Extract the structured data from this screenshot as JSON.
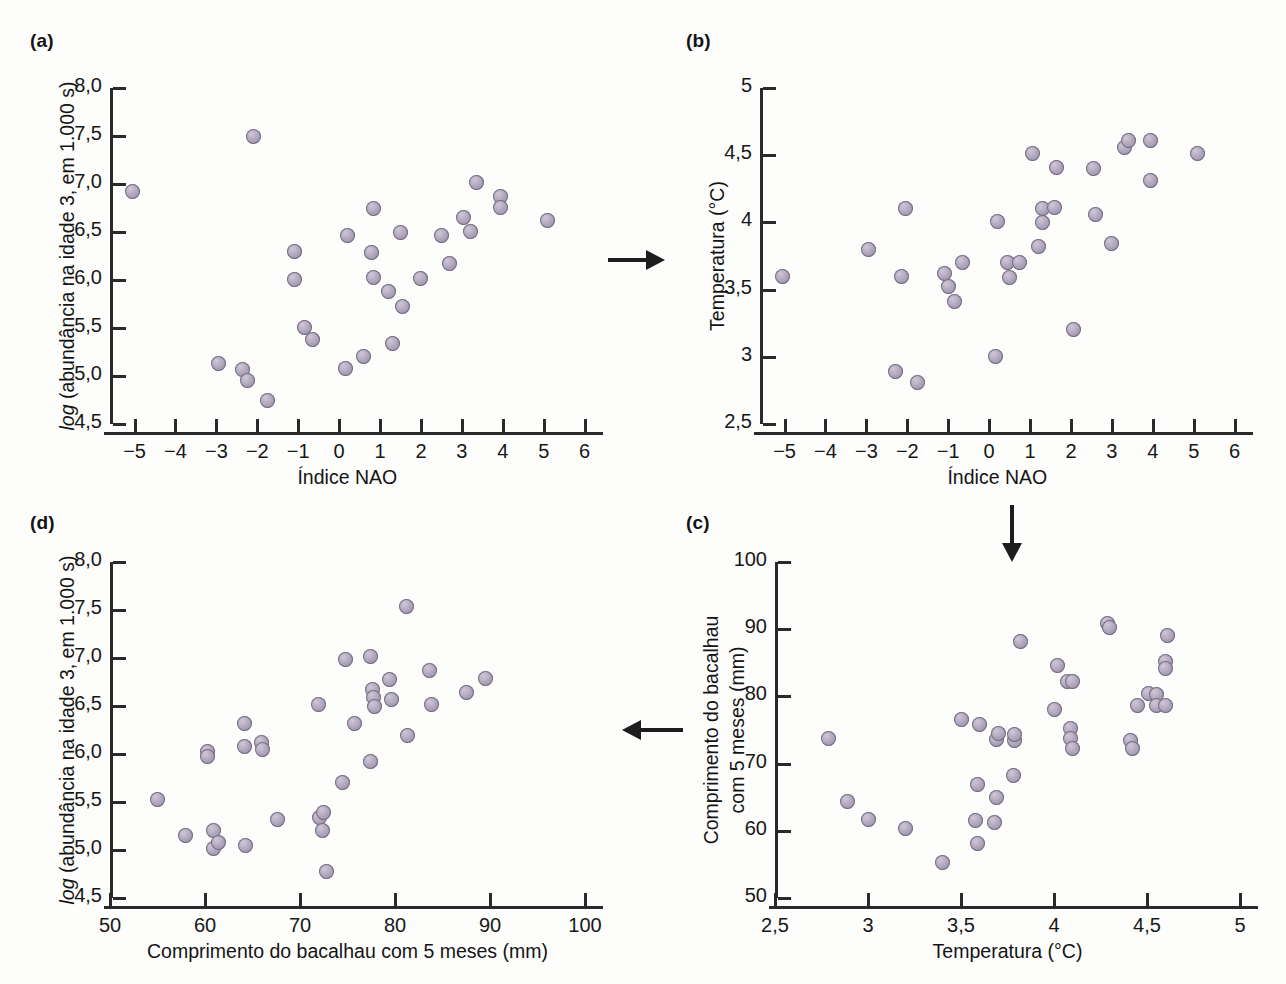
{
  "figure": {
    "background": "#fdfdfc",
    "marker_color": "#a79db5",
    "axis_color": "#2a2a2a",
    "arrow_color": "#1d1d1d"
  },
  "panels": {
    "a": {
      "label": "(a)"
    },
    "b": {
      "label": "(b)"
    },
    "c": {
      "label": "(c)"
    },
    "d": {
      "label": "(d)"
    }
  },
  "arrows": [
    {
      "name": "arrow-a-to-b",
      "direction": "right"
    },
    {
      "name": "arrow-b-to-c",
      "direction": "down"
    },
    {
      "name": "arrow-c-to-d",
      "direction": "left"
    }
  ],
  "labels": {
    "nao_index": "Índice NAO",
    "temperature": "Temperatura (°C)",
    "abundance_pre": "log",
    "abundance_post": " (abundância na idade 3, em 1.000 s)",
    "cod_length_one_line": "Comprimento do bacalhau com 5 meses (mm)",
    "cod_length_line1": "Comprimento do bacalhau",
    "cod_length_line2": "com 5 meses (mm)"
  },
  "chart_data": [
    {
      "panel": "a",
      "type": "scatter",
      "title": "(a)",
      "xlabel": "Índice NAO",
      "ylabel": "log (abundância na idade 3, em 1.000 s)",
      "xlim": [
        -5.6,
        6.4
      ],
      "ylim": [
        4.5,
        8.0
      ],
      "xticks": [
        -5,
        -4,
        -3,
        -2,
        -1,
        0,
        1,
        2,
        3,
        4,
        5,
        6
      ],
      "xticklabels": [
        "−5",
        "−4",
        "−3",
        "−2",
        "−1",
        "0",
        "1",
        "2",
        "3",
        "4",
        "5",
        "6"
      ],
      "yticks": [
        4.5,
        5.0,
        5.5,
        6.0,
        6.5,
        7.0,
        7.5,
        8.0
      ],
      "yticklabels": [
        "4,5",
        "5,0",
        "5,5",
        "6,0",
        "6,5",
        "7,0",
        "7,5",
        "8,0"
      ],
      "grid": false,
      "points": [
        [
          -5.05,
          6.92
        ],
        [
          -2.95,
          5.13
        ],
        [
          -2.35,
          5.07
        ],
        [
          -2.25,
          4.95
        ],
        [
          -2.1,
          7.5
        ],
        [
          -1.75,
          4.74
        ],
        [
          -1.1,
          6.3
        ],
        [
          -1.1,
          6.01
        ],
        [
          -0.85,
          5.51
        ],
        [
          -0.65,
          5.38
        ],
        [
          0.15,
          5.08
        ],
        [
          0.2,
          6.46
        ],
        [
          0.6,
          5.2
        ],
        [
          0.85,
          6.74
        ],
        [
          0.8,
          6.29
        ],
        [
          0.85,
          6.03
        ],
        [
          1.2,
          5.88
        ],
        [
          1.3,
          5.34
        ],
        [
          1.5,
          6.49
        ],
        [
          1.55,
          5.72
        ],
        [
          2.0,
          6.02
        ],
        [
          2.5,
          6.46
        ],
        [
          2.7,
          6.17
        ],
        [
          3.05,
          6.65
        ],
        [
          3.2,
          6.51
        ],
        [
          3.35,
          7.02
        ],
        [
          3.95,
          6.87
        ],
        [
          3.95,
          6.76
        ],
        [
          5.1,
          6.62
        ]
      ]
    },
    {
      "panel": "b",
      "type": "scatter",
      "title": "(b)",
      "xlabel": "Índice NAO",
      "ylabel": "Temperatura (°C)",
      "xlim": [
        -5.6,
        6.4
      ],
      "ylim": [
        2.5,
        5.0
      ],
      "xticks": [
        -5,
        -4,
        -3,
        -2,
        -1,
        0,
        1,
        2,
        3,
        4,
        5,
        6
      ],
      "xticklabels": [
        "−5",
        "−4",
        "−3",
        "−2",
        "−1",
        "0",
        "1",
        "2",
        "3",
        "4",
        "5",
        "6"
      ],
      "yticks": [
        2.5,
        3.0,
        3.5,
        4.0,
        4.5,
        5.0
      ],
      "yticklabels": [
        "2,5",
        "3",
        "3,5",
        "4",
        "4,5",
        "5"
      ],
      "grid": false,
      "points": [
        [
          -5.05,
          3.6
        ],
        [
          -2.95,
          3.8
        ],
        [
          -2.3,
          2.89
        ],
        [
          -2.15,
          3.6
        ],
        [
          -2.05,
          4.1
        ],
        [
          -1.75,
          2.81
        ],
        [
          -1.1,
          3.62
        ],
        [
          -1.0,
          3.52
        ],
        [
          -0.85,
          3.41
        ],
        [
          -0.65,
          3.7
        ],
        [
          0.15,
          3.0
        ],
        [
          0.2,
          4.01
        ],
        [
          0.45,
          3.7
        ],
        [
          0.5,
          3.59
        ],
        [
          0.75,
          3.7
        ],
        [
          1.05,
          4.51
        ],
        [
          1.2,
          3.82
        ],
        [
          1.3,
          4.0
        ],
        [
          1.3,
          4.1
        ],
        [
          1.6,
          4.11
        ],
        [
          1.65,
          4.41
        ],
        [
          2.05,
          3.2
        ],
        [
          2.55,
          4.4
        ],
        [
          2.6,
          4.06
        ],
        [
          3.0,
          3.84
        ],
        [
          3.3,
          4.56
        ],
        [
          3.4,
          4.61
        ],
        [
          3.95,
          4.61
        ],
        [
          3.95,
          4.31
        ],
        [
          5.1,
          4.51
        ]
      ]
    },
    {
      "panel": "c",
      "type": "scatter",
      "title": "(c)",
      "xlabel": "Temperatura (°C)",
      "ylabel": "Comprimento do bacalhau com 5 meses (mm)",
      "xlim": [
        2.5,
        5.0
      ],
      "ylim": [
        50,
        100
      ],
      "xticks": [
        2.5,
        3.0,
        3.5,
        4.0,
        4.5,
        5.0
      ],
      "xticklabels": [
        "2,5",
        "3",
        "3,5",
        "4",
        "4,5",
        "5"
      ],
      "yticks": [
        50,
        60,
        70,
        80,
        90,
        100
      ],
      "yticklabels": [
        "50",
        "60",
        "70",
        "80",
        "90",
        "100"
      ],
      "grid": false,
      "points": [
        [
          2.79,
          73.7
        ],
        [
          2.89,
          64.3
        ],
        [
          3.0,
          61.7
        ],
        [
          3.2,
          60.4
        ],
        [
          3.4,
          55.3
        ],
        [
          3.5,
          76.5
        ],
        [
          3.58,
          61.5
        ],
        [
          3.59,
          58.1
        ],
        [
          3.59,
          66.9
        ],
        [
          3.6,
          75.8
        ],
        [
          3.68,
          61.2
        ],
        [
          3.69,
          65.0
        ],
        [
          3.69,
          73.6
        ],
        [
          3.7,
          74.5
        ],
        [
          3.78,
          68.2
        ],
        [
          3.79,
          73.4
        ],
        [
          3.79,
          74.4
        ],
        [
          3.82,
          88.2
        ],
        [
          4.0,
          78.1
        ],
        [
          4.02,
          84.6
        ],
        [
          4.07,
          82.2
        ],
        [
          4.09,
          75.2
        ],
        [
          4.09,
          73.8
        ],
        [
          4.1,
          72.2
        ],
        [
          4.1,
          82.2
        ],
        [
          4.29,
          90.8
        ],
        [
          4.3,
          90.2
        ],
        [
          4.41,
          73.4
        ],
        [
          4.42,
          72.3
        ],
        [
          4.45,
          78.7
        ],
        [
          4.51,
          80.4
        ],
        [
          4.55,
          80.3
        ],
        [
          4.55,
          78.6
        ],
        [
          4.6,
          85.2
        ],
        [
          4.6,
          84.1
        ],
        [
          4.6,
          78.6
        ],
        [
          4.61,
          89.0
        ]
      ]
    },
    {
      "panel": "d",
      "type": "scatter",
      "title": "(d)",
      "xlabel": "Comprimento do bacalhau com 5 meses (mm)",
      "ylabel": "log (abundância na idade 3, em 1.000 s)",
      "xlim": [
        50,
        100
      ],
      "ylim": [
        4.5,
        8.0
      ],
      "xticks": [
        50,
        60,
        70,
        80,
        90,
        100
      ],
      "xticklabels": [
        "50",
        "60",
        "70",
        "80",
        "90",
        "100"
      ],
      "yticks": [
        4.5,
        5.0,
        5.5,
        6.0,
        6.5,
        7.0,
        7.5,
        8.0
      ],
      "yticklabels": [
        "4,5",
        "5,0",
        "5,5",
        "6,0",
        "6,5",
        "7,0",
        "7,5",
        "8,0"
      ],
      "grid": false,
      "points": [
        [
          55.0,
          5.53
        ],
        [
          57.9,
          5.15
        ],
        [
          60.3,
          6.03
        ],
        [
          60.3,
          5.97
        ],
        [
          60.9,
          5.2
        ],
        [
          60.9,
          5.02
        ],
        [
          61.4,
          5.08
        ],
        [
          64.2,
          6.32
        ],
        [
          64.2,
          6.08
        ],
        [
          64.3,
          5.05
        ],
        [
          65.9,
          6.12
        ],
        [
          66.0,
          6.05
        ],
        [
          67.6,
          5.32
        ],
        [
          71.9,
          6.52
        ],
        [
          72.1,
          5.34
        ],
        [
          72.5,
          5.39
        ],
        [
          72.4,
          5.2
        ],
        [
          72.8,
          4.78
        ],
        [
          74.5,
          5.7
        ],
        [
          74.8,
          6.98
        ],
        [
          75.7,
          6.32
        ],
        [
          77.4,
          7.02
        ],
        [
          77.4,
          5.92
        ],
        [
          77.6,
          6.67
        ],
        [
          77.7,
          6.59
        ],
        [
          77.8,
          6.49
        ],
        [
          79.4,
          6.78
        ],
        [
          79.6,
          6.57
        ],
        [
          81.2,
          7.54
        ],
        [
          81.3,
          6.19
        ],
        [
          83.6,
          6.87
        ],
        [
          83.8,
          6.52
        ],
        [
          87.5,
          6.64
        ],
        [
          89.5,
          6.79
        ]
      ]
    }
  ]
}
